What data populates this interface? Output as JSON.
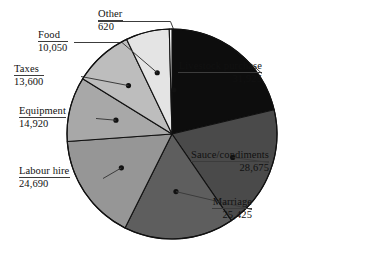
{
  "chart_data": {
    "type": "pie",
    "title": "",
    "subtitle": "",
    "xlabel": "",
    "ylabel": "",
    "legend_position": "callout-labels",
    "grid": false,
    "total": 149905,
    "start_angle_deg": -90,
    "direction": "clockwise",
    "categories": [
      "Livestock purchase",
      "Sauce/condiments",
      "Marriage",
      "Labour hire",
      "Equipment",
      "Taxes",
      "Food",
      "Other"
    ],
    "values": [
      31925,
      28675,
      25425,
      24690,
      14920,
      13600,
      10050,
      620
    ],
    "value_labels": [
      "31,925",
      "28,675",
      "25,425",
      "24,690",
      "14,920",
      "13,600",
      "10,050",
      "620"
    ],
    "colors": [
      "#0d0d0d",
      "#4a4a4a",
      "#5e5e5e",
      "#969696",
      "#a8a8a8",
      "#bdbdbd",
      "#e4e4e4",
      "#f7f7f7"
    ],
    "slices": [
      {
        "label": "Livestock purchase",
        "value": 31925,
        "value_label": "31,925",
        "color": "#0d0d0d"
      },
      {
        "label": "Sauce/condiments",
        "value": 28675,
        "value_label": "28,675",
        "color": "#4a4a4a"
      },
      {
        "label": "Marriage",
        "value": 25425,
        "value_label": "25,425",
        "color": "#5e5e5e"
      },
      {
        "label": "Labour hire",
        "value": 24690,
        "value_label": "24,690",
        "color": "#969696"
      },
      {
        "label": "Equipment",
        "value": 14920,
        "value_label": "14,920",
        "color": "#a8a8a8"
      },
      {
        "label": "Taxes",
        "value": 13600,
        "value_label": "13,600",
        "color": "#bdbdbd"
      },
      {
        "label": "Food",
        "value": 10050,
        "value_label": "10,050",
        "color": "#e4e4e4"
      },
      {
        "label": "Other",
        "value": 620,
        "value_label": "620",
        "color": "#f7f7f7"
      }
    ]
  },
  "geometry": {
    "center_x": 172,
    "center_y": 134,
    "radius": 105,
    "outline_color": "#111111",
    "leader_color": "#3c3c3c"
  }
}
